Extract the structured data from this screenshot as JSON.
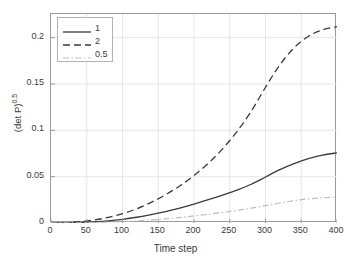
{
  "chart_data": {
    "type": "line",
    "title": "",
    "xlabel": "Time step",
    "ylabel": "(det P)",
    "ylabel_exponent": "0.5",
    "xlim": [
      0,
      400
    ],
    "ylim": [
      0,
      0.2255
    ],
    "grid": true,
    "legend_position": "upper-left",
    "xticks": [
      0,
      50,
      100,
      150,
      200,
      250,
      300,
      350,
      400
    ],
    "xticklabels": [
      "0",
      "50",
      "100",
      "150",
      "200",
      "250",
      "300",
      "350",
      "400"
    ],
    "yticks": [
      0,
      0.05,
      0.1,
      0.15,
      0.2
    ],
    "yticklabels": [
      "0",
      "0.05",
      "0.1",
      "0.15",
      "0.2"
    ],
    "x": [
      0,
      20,
      40,
      60,
      80,
      100,
      120,
      140,
      160,
      180,
      200,
      220,
      240,
      260,
      280,
      300,
      320,
      340,
      360,
      380,
      400
    ],
    "series": [
      {
        "name": "1",
        "style": "solid",
        "color": "#3a3a3a",
        "width": 1.3,
        "values": [
          0,
          0.0002,
          0.0006,
          0.0013,
          0.0024,
          0.004,
          0.0062,
          0.009,
          0.0123,
          0.0161,
          0.0204,
          0.0251,
          0.0301,
          0.0354,
          0.0418,
          0.0496,
          0.0576,
          0.0641,
          0.0694,
          0.0733,
          0.0757
        ]
      },
      {
        "name": "2",
        "style": "dashed",
        "color": "#3a3a3a",
        "width": 1.3,
        "values": [
          0,
          0.0004,
          0.0014,
          0.0032,
          0.006,
          0.01,
          0.0154,
          0.0222,
          0.0304,
          0.04,
          0.0512,
          0.0644,
          0.08,
          0.0986,
          0.1205,
          0.1465,
          0.1705,
          0.189,
          0.2015,
          0.2085,
          0.212
        ]
      },
      {
        "name": "0.5",
        "style": "dashdot",
        "color": "#bdbdbd",
        "width": 1.2,
        "values": [
          0,
          0.0001,
          0.0002,
          0.0005,
          0.0009,
          0.0015,
          0.0023,
          0.0033,
          0.0045,
          0.0059,
          0.0076,
          0.0094,
          0.0114,
          0.0136,
          0.016,
          0.0187,
          0.0216,
          0.0241,
          0.026,
          0.0272,
          0.028
        ]
      }
    ]
  },
  "legend": {
    "entries": [
      {
        "label": "1"
      },
      {
        "label": "2"
      },
      {
        "label": "0.5"
      }
    ]
  },
  "colors": {
    "axis": "#9a9a9a",
    "grid": "#e6e6e6",
    "text": "#3a3a3a",
    "series_dark": "#3a3a3a",
    "series_light": "#bdbdbd",
    "background": "#ffffff"
  }
}
